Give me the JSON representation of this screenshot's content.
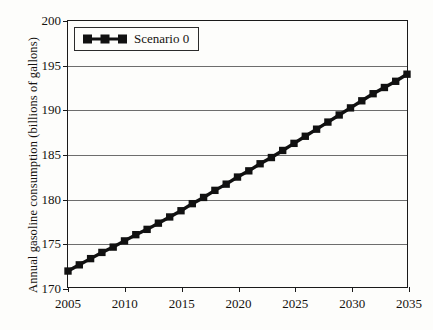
{
  "chart_data": {
    "type": "line",
    "title": "",
    "xlabel": "",
    "ylabel": "Annual gasoline consumption (billions of gallons)",
    "xlim": [
      2005,
      2035
    ],
    "ylim": [
      170,
      200
    ],
    "grid": "horizontal",
    "legend_position": "top-left",
    "xticks": [
      2005,
      2010,
      2015,
      2020,
      2025,
      2030,
      2035
    ],
    "yticks": [
      170,
      175,
      180,
      185,
      190,
      195,
      200
    ],
    "marker": "square",
    "series_color": "#111111",
    "series": [
      {
        "name": "Scenario 0",
        "x": [
          2005,
          2006,
          2007,
          2008,
          2009,
          2010,
          2011,
          2012,
          2013,
          2014,
          2015,
          2016,
          2017,
          2018,
          2019,
          2020,
          2021,
          2022,
          2023,
          2024,
          2025,
          2026,
          2027,
          2028,
          2029,
          2030,
          2031,
          2032,
          2033,
          2034,
          2035
        ],
        "values": [
          171.8,
          172.5,
          173.2,
          173.9,
          174.5,
          175.2,
          175.9,
          176.5,
          177.2,
          177.9,
          178.6,
          179.4,
          180.1,
          180.9,
          181.6,
          182.4,
          183.1,
          183.9,
          184.6,
          185.4,
          186.2,
          187.0,
          187.8,
          188.6,
          189.4,
          190.2,
          191.0,
          191.8,
          192.5,
          193.2,
          194.0
        ]
      }
    ]
  },
  "legend": {
    "entries": [
      {
        "label": "Scenario 0"
      }
    ]
  },
  "axes": {
    "y_title": "Annual gasoline consumption (billions of gallons)",
    "y_tick_labels": [
      "200",
      "195",
      "190",
      "185",
      "180",
      "175",
      "170"
    ],
    "x_tick_labels": [
      "2005",
      "2010",
      "2015",
      "2020",
      "2025",
      "2030",
      "2035"
    ]
  }
}
